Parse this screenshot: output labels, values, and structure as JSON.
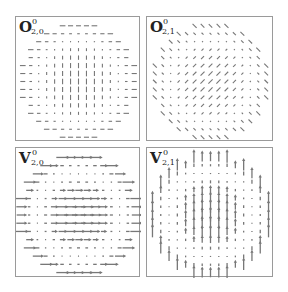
{
  "figure": {
    "panels": [
      {
        "id": "o20",
        "symbol": "O",
        "sup": "0",
        "sub": "2,0",
        "field": "o20",
        "x": 15,
        "y": 16,
        "w": 125,
        "h": 125
      },
      {
        "id": "o21",
        "symbol": "O",
        "sup": "0",
        "sub": "2,1",
        "field": "o21",
        "x": 146,
        "y": 16,
        "w": 127,
        "h": 125
      },
      {
        "id": "v20",
        "symbol": "V",
        "sup": "0",
        "sub": "2,0",
        "field": "v20",
        "x": 15,
        "y": 147,
        "w": 125,
        "h": 130
      },
      {
        "id": "v21",
        "symbol": "V",
        "sup": "0",
        "sub": "2,1",
        "field": "v21",
        "x": 146,
        "y": 147,
        "w": 127,
        "h": 130
      }
    ],
    "grid": {
      "n": 15,
      "radius": 7.4
    },
    "glyph_color": "#777777"
  }
}
